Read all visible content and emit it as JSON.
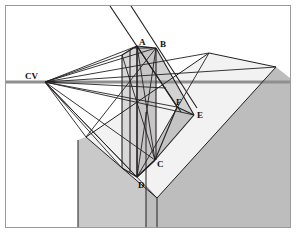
{
  "figure": {
    "frame": {
      "stroke": "#9a9a9a",
      "fill": "#ffffff",
      "x": 5,
      "y": 5,
      "width": 286,
      "height": 223
    },
    "colors": {
      "line": "#231f20",
      "horizon": "#8d8d8d",
      "ground_light": "#f0f0f0",
      "plane_light": "#ededed",
      "plane_mid": "#cfcfcf",
      "plane_dark": "#b3b3b3",
      "prism_light": "#d6d6d6",
      "prism_mid": "#c2c2c2",
      "prism_dark": "#a9a9a9",
      "background": "#ffffff"
    },
    "horizon": {
      "label": "horizon line",
      "y": 82,
      "x_start": 6,
      "x_end": 290,
      "thickness": 3
    },
    "vanishing_point": {
      "name": "CV",
      "label": "CV",
      "x": 45,
      "y": 82,
      "label_x": 25,
      "label_y": 79
    },
    "points": [
      {
        "name": "A",
        "label": "A",
        "x": 137,
        "y": 46,
        "label_x": 139,
        "label_y": 45
      },
      {
        "name": "B",
        "label": "B",
        "x": 156,
        "y": 48,
        "label_x": 159,
        "label_y": 47
      },
      {
        "name": "C",
        "label": "C",
        "x": 155,
        "y": 160,
        "label_x": 157,
        "label_y": 164
      },
      {
        "name": "D",
        "label": "D",
        "x": 137,
        "y": 177,
        "label_x": 138,
        "label_y": 185
      },
      {
        "name": "E",
        "label": "E",
        "x": 194,
        "y": 115,
        "label_x": 196,
        "label_y": 117
      },
      {
        "name": "F",
        "label": "F",
        "x": 177,
        "y": 107,
        "label_x": 177,
        "label_y": 107
      }
    ],
    "shapes": {
      "ground_block_left": "78,140 146,112 146,228 78,228",
      "ground_block_right": "146,112 276,67 276,228 146,228",
      "top_plane": "86,137 156,196 276,67 209,53",
      "wedge_face": "127,124 156,160 194,115 166,88",
      "prism_front_left": "124,56 124,176 137,177 137,48",
      "prism_front_right": "137,48 137,177 156,160 156,48",
      "prism_top": "124,56 137,48 156,48 144,56"
    },
    "caption": ""
  }
}
